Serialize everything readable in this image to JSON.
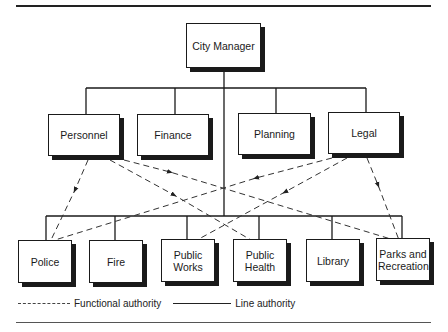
{
  "diagram": {
    "top": {
      "label": "City Manager"
    },
    "staff": [
      {
        "label": "Personnel"
      },
      {
        "label": "Finance"
      },
      {
        "label": "Planning"
      },
      {
        "label": "Legal"
      }
    ],
    "line": [
      {
        "label": "Police"
      },
      {
        "label": "Fire"
      },
      {
        "label": "Public Works"
      },
      {
        "label": "Public Health"
      },
      {
        "label": "Library"
      },
      {
        "label": "Parks and Recreation"
      }
    ],
    "functional_links": [
      {
        "from": "Personnel",
        "to": "Police"
      },
      {
        "from": "Personnel",
        "to": "Public Health"
      },
      {
        "from": "Personnel",
        "to": "Parks and Recreation"
      },
      {
        "from": "Legal",
        "to": "Police"
      },
      {
        "from": "Legal",
        "to": "Public Works"
      },
      {
        "from": "Legal",
        "to": "Parks and Recreation"
      }
    ]
  },
  "legend": {
    "functional": "Functional authority",
    "line": "Line authority"
  },
  "colors": {
    "ink": "#1a1a1a",
    "background": "#ffffff"
  }
}
